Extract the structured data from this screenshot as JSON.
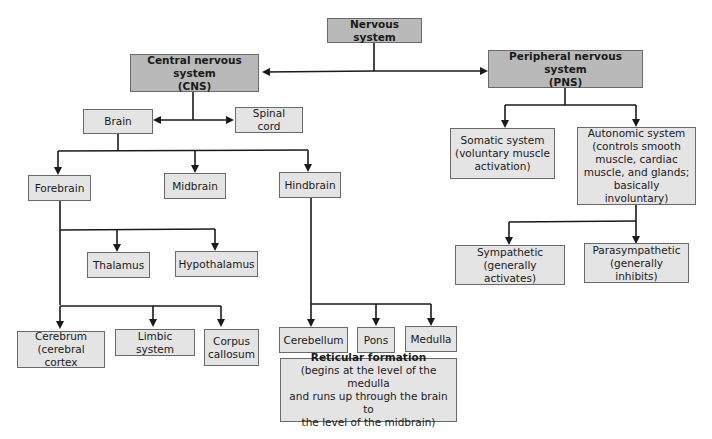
{
  "diagram": {
    "title": "Nervous system",
    "nodes": {
      "nervous_system": {
        "label": "Nervous system"
      },
      "cns": {
        "line1": "Central nervous system",
        "line2": "(CNS)"
      },
      "pns": {
        "line1": "Peripheral nervous system",
        "line2": "(PNS)"
      },
      "brain": {
        "label": "Brain"
      },
      "spinal_cord": {
        "label": "Spinal cord"
      },
      "somatic": {
        "line1": "Somatic system",
        "line2": "(voluntary muscle",
        "line3": "activation)"
      },
      "autonomic": {
        "line1": "Autonomic system",
        "line2": "(controls smooth",
        "line3": "muscle, cardiac",
        "line4": "muscle, and glands;",
        "line5": "basically involuntary)"
      },
      "sympathetic": {
        "line1": "Sympathetic",
        "line2": "(generally activates)"
      },
      "parasympathetic": {
        "line1": "Parasympathetic",
        "line2": "(generally inhibits)"
      },
      "forebrain": {
        "label": "Forebrain"
      },
      "midbrain": {
        "label": "Midbrain"
      },
      "hindbrain": {
        "label": "Hindbrain"
      },
      "thalamus": {
        "label": "Thalamus"
      },
      "hypothalamus": {
        "label": "Hypothalamus"
      },
      "cerebrum": {
        "line1": "Cerebrum",
        "line2": "(cerebral cortex"
      },
      "limbic": {
        "label": "Limbic system"
      },
      "corpus": {
        "line1": "Corpus",
        "line2": "callosum"
      },
      "cerebellum": {
        "label": "Cerebellum"
      },
      "pons": {
        "label": "Pons"
      },
      "medulla": {
        "label": "Medulla"
      },
      "reticular": {
        "line1": "Reticular formation",
        "line2": "(begins at the level of the medulla",
        "line3": "and runs up through the brain to",
        "line4": "the level of the midbrain)"
      }
    },
    "colors": {
      "dark_box": "#b9b9b9",
      "light_box": "#e4e4e4",
      "line": "#1a1a1a"
    }
  }
}
